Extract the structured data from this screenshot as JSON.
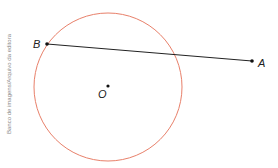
{
  "credit": "Banco de imagens/Arquivo da editora",
  "colors": {
    "circle": "#e8806a",
    "segment": "#222222",
    "points": "#111111"
  },
  "points": {
    "B": {
      "label": "B",
      "x": 47,
      "y": 44
    },
    "A": {
      "label": "A",
      "x": 252,
      "y": 61
    },
    "O": {
      "label": "O",
      "x": 108,
      "y": 87
    }
  },
  "circle": {
    "center": "O",
    "cx": 108,
    "cy": 87,
    "r": 74
  },
  "segment": {
    "from": "B",
    "to": "A"
  }
}
